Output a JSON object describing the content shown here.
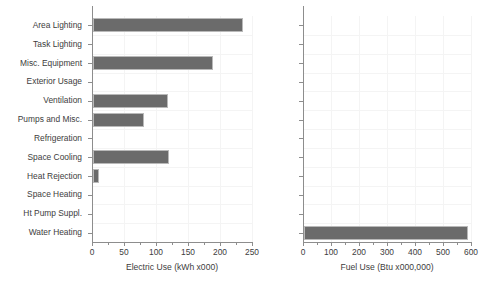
{
  "chart_data": [
    {
      "type": "bar",
      "orientation": "horizontal",
      "title": "",
      "xlabel": "Electric Use (kWh x000)",
      "ylabel": "",
      "xlim": [
        0,
        250
      ],
      "xticks": [
        0,
        50,
        100,
        150,
        200,
        250
      ],
      "xtick_labels": [
        "0",
        "50",
        "100",
        "150",
        "200",
        "250"
      ],
      "minor_tick_interval": 25,
      "grid": true,
      "legend": "none",
      "bar_color": "#6b6b6b",
      "categories": [
        "Area Lighting",
        "Task Lighting",
        "Misc. Equipment",
        "Exterior Usage",
        "Ventilation",
        "Pumps and Misc.",
        "Refrigeration",
        "Space Cooling",
        "Heat Rejection",
        "Space Heating",
        "Ht Pump Suppl.",
        "Water Heating"
      ],
      "values": [
        235,
        0,
        188,
        0,
        117,
        80,
        0,
        118,
        10,
        0,
        0,
        0
      ]
    },
    {
      "type": "bar",
      "orientation": "horizontal",
      "title": "",
      "xlabel": "Fuel Use (Btu x000,000)",
      "ylabel": "",
      "xlim": [
        0,
        600
      ],
      "xticks": [
        0,
        100,
        200,
        300,
        400,
        500,
        600
      ],
      "xtick_labels": [
        "0",
        "100",
        "200",
        "300",
        "400",
        "500",
        "600"
      ],
      "minor_tick_interval": 50,
      "grid": true,
      "legend": "none",
      "bar_color": "#6b6b6b",
      "categories": [
        "Area Lighting",
        "Task Lighting",
        "Misc. Equipment",
        "Exterior Usage",
        "Ventilation",
        "Pumps and Misc.",
        "Refrigeration",
        "Space Cooling",
        "Heat Rejection",
        "Space Heating",
        "Ht Pump Suppl.",
        "Water Heating"
      ],
      "values": [
        0,
        0,
        0,
        0,
        0,
        0,
        0,
        0,
        0,
        0,
        0,
        585
      ]
    }
  ]
}
